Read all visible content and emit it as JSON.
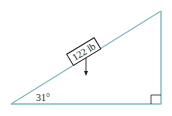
{
  "diagram": {
    "type": "inclined-plane",
    "block_label": "122 lb",
    "angle_label": "31°",
    "angle_degrees": 31,
    "right_angle_marker": true,
    "force_arrow": "downward",
    "colors": {
      "triangle": "#7fb8c0",
      "block_border": "#231f20",
      "text": "#231f20",
      "background": "#ffffff"
    }
  }
}
